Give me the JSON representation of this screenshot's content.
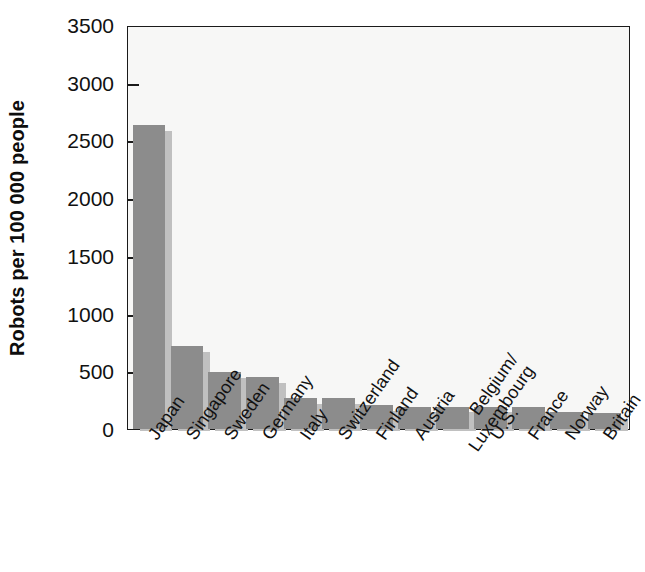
{
  "chart_data": {
    "type": "bar",
    "title": "",
    "xlabel": "",
    "ylabel": "Robots per 100 000 people",
    "ylim": [
      0,
      3500
    ],
    "ytick_values": [
      0,
      500,
      1000,
      1500,
      2000,
      2500,
      3000,
      3500
    ],
    "ytick_labels": [
      "0",
      "500",
      "1000",
      "1500",
      "2000",
      "2500",
      "3000",
      "3500"
    ],
    "grid": false,
    "legend": null,
    "bar_color": "#8c8c8c",
    "shadow_color": "#c0c0c0",
    "plot_background": "#f7f7f6",
    "axis_color": "#1a1a1a",
    "categories": [
      "Japan",
      "Singapore",
      "Sweden",
      "Germany",
      "Italy",
      "Switzerland",
      "Finland",
      "Austria",
      "Belgium/\nLuxembourg",
      "U.S.",
      "France",
      "Norway",
      "Britain"
    ],
    "values": [
      2630,
      715,
      490,
      450,
      265,
      265,
      210,
      195,
      195,
      195,
      195,
      150,
      140
    ]
  }
}
